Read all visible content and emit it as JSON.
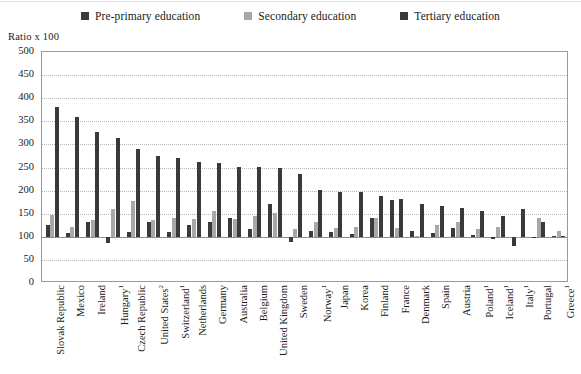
{
  "legend": {
    "items": [
      {
        "label": "Pre-primary education",
        "color": "#3a3a3a",
        "icon": "square-marker-icon"
      },
      {
        "label": "Secondary education",
        "color": "#a8a8a8",
        "icon": "square-marker-icon"
      },
      {
        "label": "Tertiary education",
        "color": "#3a3a3a",
        "icon": "square-marker-icon"
      }
    ]
  },
  "axis_title": "Ratio x 100",
  "chart_data": {
    "type": "bar",
    "title": "",
    "subtitle": "",
    "xlabel": "",
    "ylabel": "Ratio x 100",
    "ylim": [
      0,
      500
    ],
    "yticks": [
      0,
      50,
      100,
      150,
      200,
      250,
      300,
      350,
      400,
      450,
      500
    ],
    "grid": true,
    "baseline": 100,
    "legend_position": "top",
    "categories": [
      "Slovak Republic",
      "Mexico",
      "Ireland",
      "Hungary¹",
      "Czech Republic",
      "United States²",
      "Switzerland¹",
      "Netherlands",
      "Germany",
      "Australia",
      "Belgium",
      "United Kingdom",
      "Sweden",
      "Norway¹",
      "Japan",
      "Korea",
      "Finland",
      "France",
      "Denmark",
      "Spain",
      "Austria",
      "Poland¹",
      "Iceland¹",
      "Italy¹",
      "Portugal",
      "Greece¹"
    ],
    "series": [
      {
        "name": "Pre-primary education",
        "color": "#3a3a3a",
        "values": [
          126,
          109,
          133,
          86,
          111,
          132,
          110,
          126,
          132,
          141,
          117,
          172,
          88,
          113,
          110,
          107,
          140,
          179,
          112,
          108,
          118,
          103,
          95,
          80,
          100,
          101
        ]
      },
      {
        "name": "Secondary education",
        "color": "#a8a8a8",
        "values": [
          148,
          122,
          137,
          160,
          178,
          137,
          141,
          138,
          155,
          139,
          145,
          152,
          116,
          133,
          118,
          122,
          140,
          118,
          101,
          126,
          131,
          117,
          122,
          99,
          140,
          112
        ]
      },
      {
        "name": "Tertiary education",
        "color": "#3a3a3a",
        "values": [
          381,
          360,
          327,
          313,
          289,
          275,
          271,
          261,
          259,
          252,
          251,
          248,
          236,
          201,
          198,
          197,
          188,
          181,
          170,
          167,
          163,
          155,
          146,
          161,
          132,
          101
        ]
      }
    ]
  }
}
